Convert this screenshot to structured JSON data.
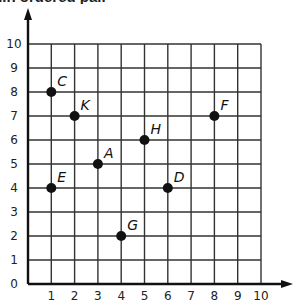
{
  "header": {
    "title_fragment": "...n ordered pair"
  },
  "chart_data": {
    "type": "scatter",
    "title": "",
    "xlabel": "",
    "ylabel": "",
    "xlim": [
      0,
      10
    ],
    "ylim": [
      0,
      10
    ],
    "grid": true,
    "x_ticks": [
      "1",
      "2",
      "3",
      "4",
      "5",
      "6",
      "7",
      "8",
      "9",
      "10"
    ],
    "y_ticks": [
      "0",
      "1",
      "2",
      "3",
      "4",
      "5",
      "6",
      "7",
      "8",
      "9",
      "10"
    ],
    "points": [
      {
        "label": "C",
        "x": 1,
        "y": 8
      },
      {
        "label": "K",
        "x": 2,
        "y": 7
      },
      {
        "label": "H",
        "x": 5,
        "y": 6
      },
      {
        "label": "F",
        "x": 8,
        "y": 7
      },
      {
        "label": "A",
        "x": 3,
        "y": 5
      },
      {
        "label": "E",
        "x": 1,
        "y": 4
      },
      {
        "label": "D",
        "x": 6,
        "y": 4
      },
      {
        "label": "G",
        "x": 4,
        "y": 2
      }
    ],
    "colors": {
      "grid": "#333333",
      "axis": "#111111",
      "point": "#111111"
    }
  }
}
